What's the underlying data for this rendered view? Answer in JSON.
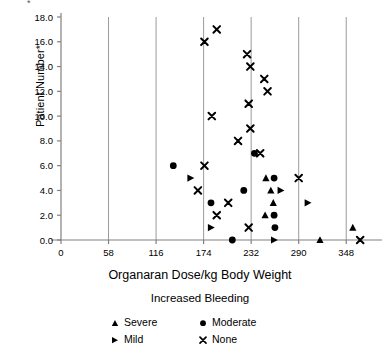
{
  "chart_data": {
    "type": "scatter",
    "title": "",
    "xlabel": "Organaran Dose/kg Body Weight",
    "ylabel": "Patient Number*",
    "xlim": [
      0,
      377
    ],
    "ylim": [
      0,
      18
    ],
    "xticks": [
      "0",
      "58",
      "116",
      "174",
      "232",
      "290",
      "348"
    ],
    "xtick_values": [
      0,
      58,
      116,
      174,
      232,
      290,
      348
    ],
    "yticks": [
      "0.0",
      "2.0",
      "4.0",
      "6.0",
      "8.0",
      "10.0",
      "12.0",
      "14.0",
      "16.0",
      "18.0"
    ],
    "ytick_values": [
      0,
      2,
      4,
      6,
      8,
      10,
      12,
      14,
      16,
      18
    ],
    "grid": "vertical-major",
    "legend_position": "below-plot",
    "legend_title": "Increased Bleeding",
    "series": [
      {
        "name": "Severe",
        "marker": "triangle-up",
        "color": "#000000",
        "points": [
          {
            "x": 250,
            "y": 5
          },
          {
            "x": 256,
            "y": 4
          },
          {
            "x": 259,
            "y": 3
          },
          {
            "x": 249,
            "y": 2
          },
          {
            "x": 356,
            "y": 1
          },
          {
            "x": 316,
            "y": 0
          }
        ]
      },
      {
        "name": "Moderate",
        "marker": "circle",
        "color": "#000000",
        "points": [
          {
            "x": 236,
            "y": 7
          },
          {
            "x": 137,
            "y": 6
          },
          {
            "x": 260,
            "y": 5
          },
          {
            "x": 223,
            "y": 4
          },
          {
            "x": 183,
            "y": 3
          },
          {
            "x": 260,
            "y": 2
          },
          {
            "x": 261,
            "y": 1
          },
          {
            "x": 209,
            "y": 0
          }
        ]
      },
      {
        "name": "Mild",
        "marker": "triangle-right",
        "color": "#000000",
        "points": [
          {
            "x": 158,
            "y": 5
          },
          {
            "x": 268,
            "y": 4
          },
          {
            "x": 301,
            "y": 3
          },
          {
            "x": 183,
            "y": 1
          },
          {
            "x": 260,
            "y": 0
          }
        ]
      },
      {
        "name": "None",
        "marker": "x",
        "color": "#000000",
        "points": [
          {
            "x": 190,
            "y": 17
          },
          {
            "x": 175,
            "y": 16
          },
          {
            "x": 227,
            "y": 15
          },
          {
            "x": 231,
            "y": 14
          },
          {
            "x": 248,
            "y": 13
          },
          {
            "x": 252,
            "y": 12
          },
          {
            "x": 229,
            "y": 11
          },
          {
            "x": 184,
            "y": 10
          },
          {
            "x": 231,
            "y": 9
          },
          {
            "x": 216,
            "y": 8
          },
          {
            "x": 243,
            "y": 7
          },
          {
            "x": 175,
            "y": 6
          },
          {
            "x": 290,
            "y": 5
          },
          {
            "x": 167,
            "y": 4
          },
          {
            "x": 204,
            "y": 3
          },
          {
            "x": 190,
            "y": 2
          },
          {
            "x": 229,
            "y": 1
          },
          {
            "x": 365,
            "y": 0
          }
        ]
      }
    ]
  },
  "axes": {
    "y_axis_label": "Patient Number*",
    "x_axis_label": "Organaran Dose/kg Body Weight",
    "footnote_mark": "*"
  },
  "legend": {
    "title": "Increased Bleeding",
    "entries": [
      {
        "label": "Severe",
        "glyph": "triangle-up-icon"
      },
      {
        "label": "Moderate",
        "glyph": "circle-icon"
      },
      {
        "label": "Mild",
        "glyph": "triangle-right-icon"
      },
      {
        "label": "None",
        "glyph": "x-mark-icon"
      }
    ]
  }
}
